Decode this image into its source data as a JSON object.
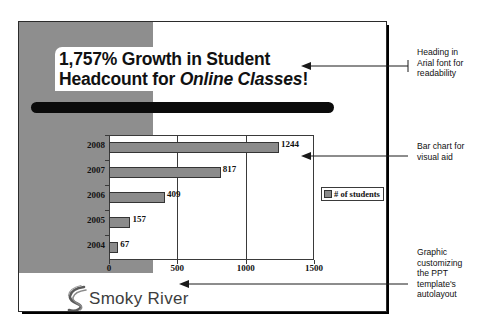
{
  "slide": {
    "title_line1": "1,757% Growth in Student",
    "title_line2_prefix": "Headcount for ",
    "title_line2_italic": "Online Classes",
    "title_line2_suffix": "!",
    "logo_text": "moky River",
    "logo_initial": "S",
    "redaction_label": "redacted-text-bar"
  },
  "chart_data": {
    "type": "bar",
    "orientation": "horizontal",
    "title": "",
    "xlabel": "",
    "ylabel": "",
    "categories": [
      "2004",
      "2005",
      "2006",
      "2007",
      "2008"
    ],
    "values": [
      67,
      157,
      409,
      817,
      1244
    ],
    "series": [
      {
        "name": "# of students",
        "values": [
          67,
          157,
          409,
          817,
          1244
        ]
      }
    ],
    "data_labels": [
      "67",
      "157",
      "409",
      "817",
      "1244"
    ],
    "xlim": [
      0,
      1500
    ],
    "xticks": [
      0,
      500,
      1000,
      1500
    ],
    "xtick_labels": [
      "0",
      "500",
      "1000",
      "1500"
    ],
    "grid": "vertical",
    "legend": {
      "position": "right",
      "entries": [
        "# of students"
      ]
    },
    "bar_color": "#8b8b8b",
    "bar_border_color": "#343434"
  },
  "annotations": [
    {
      "id": "heading-note",
      "text": "Heading in\nArial font for\nreadability"
    },
    {
      "id": "chart-note",
      "text": "Bar chart for\nvisual aid"
    },
    {
      "id": "graphic-note",
      "text": "Graphic\ncustomizing\nthe PPT\ntemplate's\nautolayout"
    }
  ],
  "colors": {
    "accent_gray": "#8e8e8e",
    "bar": "#8b8b8b",
    "ink": "#111111",
    "shadow": "#000000"
  }
}
